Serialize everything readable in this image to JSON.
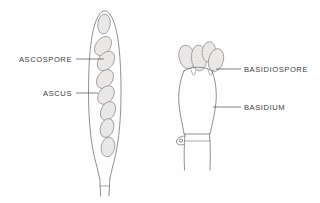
{
  "figure": {
    "background_color": "#fefefe",
    "ink_color": "#6e6e70",
    "spore_fill_color": "#e8e6e4",
    "label_color": "#3f3f41"
  },
  "labels": [
    {
      "id": "ascospore",
      "text": "ASCOSPORE",
      "text_anchor": "end",
      "text_x": 72,
      "text_y": 62,
      "leader_x1": 76,
      "leader_y1": 59,
      "leader_x2": 104,
      "leader_y2": 59
    },
    {
      "id": "ascus",
      "text": "ASCUS",
      "text_anchor": "end",
      "text_x": 72,
      "text_y": 96,
      "leader_x1": 76,
      "leader_y1": 93,
      "leader_x2": 98,
      "leader_y2": 93
    },
    {
      "id": "basidiospore",
      "text": "BASIDIOSPORE",
      "text_anchor": "start",
      "text_x": 244,
      "text_y": 72,
      "leader_x1": 216,
      "leader_y1": 69,
      "leader_x2": 241,
      "leader_y2": 69
    },
    {
      "id": "basidium",
      "text": "BASIDIUM",
      "text_anchor": "start",
      "text_x": 244,
      "text_y": 110,
      "leader_x1": 213,
      "leader_y1": 107,
      "leader_x2": 241,
      "leader_y2": 107
    }
  ],
  "ascus": {
    "name": "ascus",
    "spore_count": 8,
    "spores": [
      {
        "cx": 104,
        "cy": 24,
        "rx": 6.2,
        "ry": 10.0,
        "rot": 8
      },
      {
        "cx": 103,
        "cy": 46,
        "rx": 7.2,
        "ry": 10.6,
        "rot": 36
      },
      {
        "cx": 106,
        "cy": 61,
        "rx": 7.4,
        "ry": 10.8,
        "rot": 36
      },
      {
        "cx": 105,
        "cy": 79,
        "rx": 7.4,
        "ry": 10.4,
        "rot": 36
      },
      {
        "cx": 106,
        "cy": 95,
        "rx": 7.2,
        "ry": 10.2,
        "rot": 36
      },
      {
        "cx": 108,
        "cy": 111,
        "rx": 7.0,
        "ry": 10.0,
        "rot": 26
      },
      {
        "cx": 107,
        "cy": 128,
        "rx": 6.6,
        "ry": 9.6,
        "rot": 18
      },
      {
        "cx": 108,
        "cy": 147,
        "rx": 6.8,
        "ry": 9.8,
        "rot": 10
      }
    ]
  },
  "basidium": {
    "name": "basidium",
    "spore_count": 4,
    "spores": [
      {
        "cx": 187,
        "cy": 57,
        "rx": 8.0,
        "ry": 12.0,
        "rot": -14
      },
      {
        "cx": 199,
        "cy": 58,
        "rx": 7.6,
        "ry": 13.0,
        "rot": -3
      },
      {
        "cx": 209,
        "cy": 52,
        "rx": 6.8,
        "ry": 10.4,
        "rot": 4
      },
      {
        "cx": 216,
        "cy": 60,
        "rx": 7.4,
        "ry": 11.6,
        "rot": 14
      }
    ],
    "has_clamp_connection": true
  }
}
